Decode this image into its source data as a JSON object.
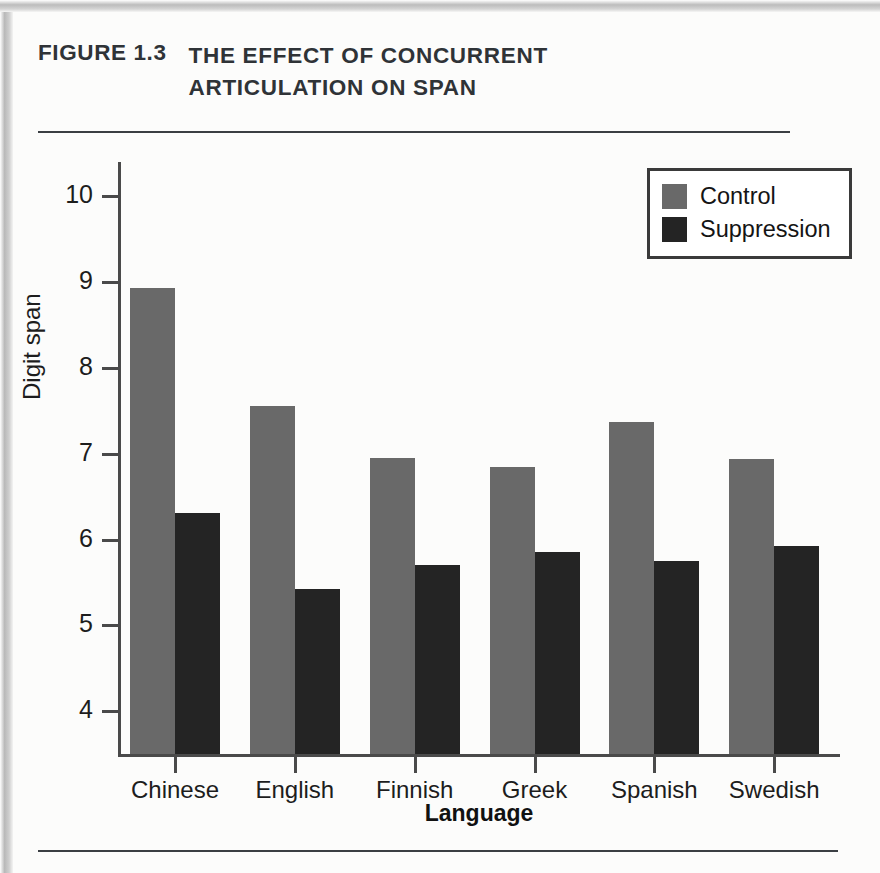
{
  "figure": {
    "number": "FIGURE 1.3",
    "title_line1": "THE EFFECT OF CONCURRENT",
    "title_line2": "ARTICULATION ON SPAN"
  },
  "legend": {
    "position": "top-right",
    "entries": [
      {
        "label": "Control",
        "color": "#696969"
      },
      {
        "label": "Suppression",
        "color": "#242424"
      }
    ]
  },
  "axes": {
    "y_title": "Digit span",
    "x_title": "Language",
    "y_ticks": [
      "4",
      "5",
      "6",
      "7",
      "8",
      "9",
      "10"
    ]
  },
  "chart_data": {
    "type": "bar",
    "title": "FIGURE 1.3 THE EFFECT OF CONCURRENT ARTICULATION ON SPAN",
    "xlabel": "Language",
    "ylabel": "Digit span",
    "ylim": [
      3.5,
      10.4
    ],
    "ytick_values": [
      4,
      5,
      6,
      7,
      8,
      9,
      10
    ],
    "grid": false,
    "legend_position": "top-right",
    "categories": [
      "Chinese",
      "English",
      "Finnish",
      "Greek",
      "Spanish",
      "Swedish"
    ],
    "series": [
      {
        "name": "Control",
        "color": "#696969",
        "values": [
          8.93,
          7.56,
          6.95,
          6.85,
          7.37,
          6.94
        ]
      },
      {
        "name": "Suppression",
        "color": "#242424",
        "values": [
          6.31,
          5.42,
          5.7,
          5.85,
          5.75,
          5.92
        ]
      }
    ]
  }
}
